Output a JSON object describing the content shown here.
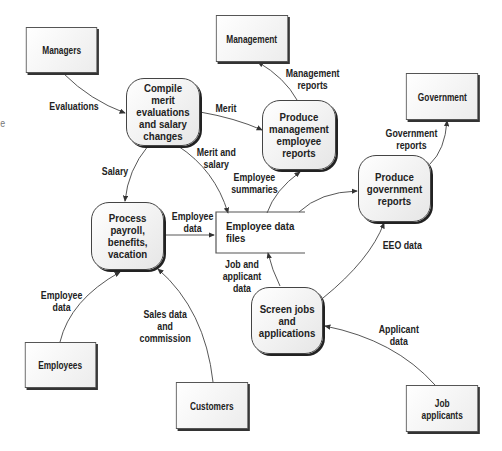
{
  "diagram": {
    "type": "data-flow-diagram",
    "margin_fragment": "e",
    "external_entities": [
      {
        "id": "managers",
        "label": "Managers"
      },
      {
        "id": "management",
        "label": "Management"
      },
      {
        "id": "government",
        "label": "Government"
      },
      {
        "id": "employees",
        "label": "Employees"
      },
      {
        "id": "customers",
        "label": "Customers"
      },
      {
        "id": "job_applicants",
        "label": "Job\napplicants"
      }
    ],
    "processes": [
      {
        "id": "compile_merit",
        "label": "Compile merit\nevaluations\nand salary\nchanges"
      },
      {
        "id": "produce_mgmt_reports",
        "label": "Produce\nmanagement\nemployee\nreports"
      },
      {
        "id": "process_payroll",
        "label": "Process\npayroll,\nbenefits,\nvacation"
      },
      {
        "id": "produce_gov_reports",
        "label": "Produce\ngovernment\nreports"
      },
      {
        "id": "screen_jobs",
        "label": "Screen jobs\nand\napplications"
      }
    ],
    "data_stores": [
      {
        "id": "employee_data_files",
        "label": "Employee data\nfiles"
      }
    ],
    "flows": [
      {
        "from": "managers",
        "to": "compile_merit",
        "label": "Evaluations"
      },
      {
        "from": "compile_merit",
        "to": "produce_mgmt_reports",
        "label": "Merit"
      },
      {
        "from": "produce_mgmt_reports",
        "to": "management",
        "label": "Management\nreports"
      },
      {
        "from": "compile_merit",
        "to": "process_payroll",
        "label": "Salary"
      },
      {
        "from": "compile_merit",
        "to": "employee_data_files",
        "label": "Merit and\nsalary"
      },
      {
        "from": "employee_data_files",
        "to": "produce_mgmt_reports",
        "label": "Employee\nsummaries"
      },
      {
        "from": "process_payroll",
        "to": "employee_data_files",
        "label": "Employee\ndata"
      },
      {
        "from": "employee_data_files",
        "to": "produce_gov_reports",
        "label": ""
      },
      {
        "from": "produce_gov_reports",
        "to": "government",
        "label": "Government\nreports"
      },
      {
        "from": "screen_jobs",
        "to": "produce_gov_reports",
        "label": "EEO data"
      },
      {
        "from": "screen_jobs",
        "to": "employee_data_files",
        "label": "Job and\napplicant\ndata"
      },
      {
        "from": "employees",
        "to": "process_payroll",
        "label": "Employee\ndata"
      },
      {
        "from": "customers",
        "to": "process_payroll",
        "label": "Sales data\nand\ncommission"
      },
      {
        "from": "job_applicants",
        "to": "screen_jobs",
        "label": "Applicant\ndata"
      }
    ]
  }
}
